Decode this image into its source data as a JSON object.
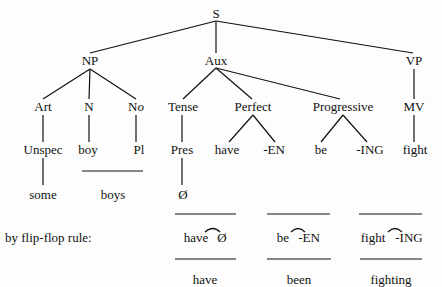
{
  "tree": {
    "root": "S",
    "level1": [
      "NP",
      "Aux",
      "VP"
    ],
    "level2": {
      "np_children": [
        "Art",
        "N",
        "No"
      ],
      "aux_children": [
        "Tense",
        "Perfect",
        "Progressive"
      ],
      "vp_children": [
        "MV"
      ]
    },
    "level3": {
      "art": "Unspec",
      "n": "boy",
      "no": "Pl",
      "tense": "Pres",
      "perfect": [
        "have",
        "-EN"
      ],
      "progressive": [
        "be",
        "-ING"
      ],
      "mv": "fight"
    },
    "level4": {
      "art": "some",
      "n_no": "boys",
      "tense": "Ø"
    }
  },
  "flip_flop": {
    "label": "by flip-flop rule:",
    "pairs": [
      {
        "left": "have",
        "right": "Ø",
        "result": "have"
      },
      {
        "left": "be",
        "right": "-EN",
        "result": "been"
      },
      {
        "left": "fight",
        "right": "-ING",
        "result": "fighting"
      }
    ]
  },
  "labels": {
    "s": "S",
    "np": "NP",
    "aux": "Aux",
    "vp": "VP",
    "art": "Art",
    "n": "N",
    "no_n": "N",
    "no_o": "o",
    "tense": "Tense",
    "perfect": "Perfect",
    "progressive": "Progressive",
    "mv": "MV",
    "unspec": "Unspec",
    "boy": "boy",
    "pl": "Pl",
    "pres": "Pres",
    "have": "have",
    "en": "-EN",
    "be": "be",
    "ing": "-ING",
    "fight": "fight",
    "some": "some",
    "boys": "boys",
    "null": "Ø",
    "ff_label": "by flip-flop rule:",
    "ff1_left": "have",
    "ff1_right": "Ø",
    "ff1_result": "have",
    "ff2_left": "be",
    "ff2_right": "-EN",
    "ff2_result": "been",
    "ff3_left": "fight",
    "ff3_right": "-ING",
    "ff3_result": "fighting"
  }
}
